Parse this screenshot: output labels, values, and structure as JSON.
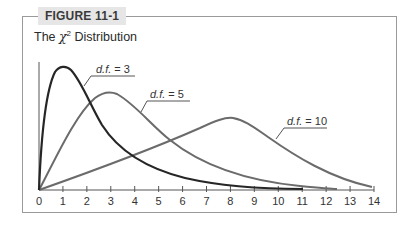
{
  "figure": {
    "tag": "FIGURE 11-1",
    "title_prefix": "The ",
    "title_symbol": "χ",
    "title_superscript": "2",
    "title_suffix": " Distribution"
  },
  "colors": {
    "frame": "#9a9a9a",
    "tag_bg": "#e6e6e6",
    "curve_df3": "#262626",
    "curve_df5": "#6b6b6b",
    "curve_df10": "#6b6b6b",
    "axis": "#555555"
  },
  "chart_data": {
    "type": "line",
    "xlabel": "",
    "ylabel": "",
    "xlim": [
      0,
      14
    ],
    "x_ticks": [
      "0",
      "1",
      "2",
      "3",
      "4",
      "5",
      "6",
      "7",
      "8",
      "9",
      "10",
      "11",
      "12",
      "13",
      "14"
    ],
    "grid": false,
    "legend": "inline labels with leader lines",
    "series": [
      {
        "name": "d.f. = 3",
        "label_italic": "d.f.",
        "label_value": "= 3",
        "peak_x": 1,
        "x_end": 11
      },
      {
        "name": "d.f. = 5",
        "label_italic": "d.f.",
        "label_value": "= 5",
        "peak_x": 3,
        "x_end": 12.4
      },
      {
        "name": "d.f. = 10",
        "label_italic": "d.f.",
        "label_value": "= 10",
        "peak_x": 8,
        "x_end": 14
      }
    ]
  }
}
